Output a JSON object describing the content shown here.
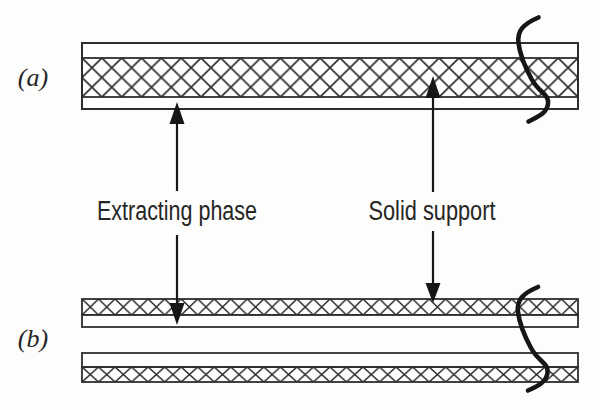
{
  "figure": {
    "panel_a": {
      "label": "(a)"
    },
    "panel_b": {
      "label": "(b)"
    },
    "callouts": {
      "extracting_phase": "Extracting phase",
      "solid_support": "Solid support"
    }
  },
  "colors": {
    "background": "#fdfdfb",
    "line_ink": "#2e2e2e",
    "solid_ink": "#161616",
    "text_ink": "#262626"
  },
  "icons": {
    "break_mark_a": "squiggle-break-line-icon",
    "break_mark_b": "squiggle-break-line-icon",
    "extracting_phase_arrow": "double-headed-vertical-arrow-icon",
    "solid_support_arrow": "double-headed-vertical-arrow-icon"
  }
}
